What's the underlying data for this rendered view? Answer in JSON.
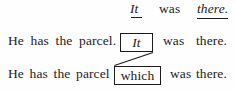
{
  "figure": {
    "kind": "grammar-transformation-diagram",
    "ink_color": "#1c1c1c",
    "background_color": "#fefefe",
    "lines": [
      {
        "id": "line-1",
        "tokens": [
          {
            "text": "It",
            "style": "italic",
            "underlined": true
          },
          {
            "text": "was",
            "style": "roman",
            "underlined": false
          },
          {
            "text": "there.",
            "style": "italic",
            "underlined": true
          }
        ]
      },
      {
        "id": "line-2",
        "lead": "He has the parcel.",
        "boxed": {
          "text": "It",
          "style": "italic"
        },
        "tail_1": "was",
        "tail_2": "there."
      },
      {
        "id": "line-3",
        "lead": "He has the parcel",
        "boxed": {
          "text": "which",
          "style": "roman"
        },
        "tail": "was there."
      }
    ],
    "connector": {
      "kind": "diagonal-line",
      "from": "it-box-bottom-right",
      "to": "which-box-top-left"
    }
  }
}
